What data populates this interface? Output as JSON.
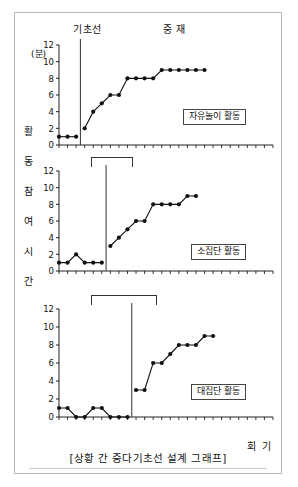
{
  "figure": {
    "caption": "[상황 간 중다기초선 설계 그래프]",
    "y_axis_title_chars": [
      "활",
      "동",
      "참",
      "여",
      "시",
      "간"
    ],
    "y_axis_unit": "(분)",
    "x_axis_title": "회 기",
    "phases": {
      "baseline": "기초선",
      "intervention": "중 재"
    }
  },
  "chart_data": [
    {
      "type": "line",
      "title": "자유놀이 활동",
      "panel_label": "자유놀이 활동",
      "xlabel": "회 기",
      "ylabel": "활동참여시간",
      "yunit": "(분)",
      "ylim": [
        0,
        12
      ],
      "yticks": [
        0,
        2,
        4,
        6,
        8,
        10,
        12
      ],
      "xlim": [
        1,
        26
      ],
      "xticks_count": 26,
      "grid": false,
      "legend": "none",
      "phase_change_x": 3.5,
      "series": [
        {
          "name": "기초선",
          "x": [
            1,
            2,
            3
          ],
          "values": [
            1,
            1,
            1
          ]
        },
        {
          "name": "중재",
          "x": [
            4,
            5,
            6,
            7,
            8,
            9,
            10,
            11,
            12,
            13,
            14,
            15,
            16,
            17,
            18
          ],
          "values": [
            2,
            4,
            5,
            6,
            6,
            8,
            8,
            8,
            8,
            9,
            9,
            9,
            9,
            9,
            9
          ]
        }
      ]
    },
    {
      "type": "line",
      "title": "소집단 활동",
      "panel_label": "소집단 활동",
      "xlabel": "회 기",
      "ylabel": "활동참여시간",
      "yunit": "(분)",
      "ylim": [
        0,
        12
      ],
      "yticks": [
        0,
        2,
        4,
        6,
        8,
        10,
        12
      ],
      "xlim": [
        1,
        26
      ],
      "xticks_count": 26,
      "grid": false,
      "legend": "none",
      "phase_change_x": 6.5,
      "series": [
        {
          "name": "기초선",
          "x": [
            1,
            2,
            3,
            4,
            5,
            6
          ],
          "values": [
            1,
            1,
            2,
            1,
            1,
            1
          ]
        },
        {
          "name": "중재",
          "x": [
            7,
            8,
            9,
            10,
            11,
            12,
            13,
            14,
            15,
            16,
            17
          ],
          "values": [
            3,
            4,
            5,
            6,
            6,
            8,
            8,
            8,
            8,
            9,
            9
          ]
        }
      ]
    },
    {
      "type": "line",
      "title": "대집단 활동",
      "panel_label": "대집단 활동",
      "xlabel": "회 기",
      "ylabel": "활동참여시간",
      "yunit": "(분)",
      "ylim": [
        0,
        12
      ],
      "yticks": [
        0,
        2,
        4,
        6,
        8,
        10,
        12
      ],
      "xlim": [
        1,
        26
      ],
      "xticks_count": 26,
      "grid": false,
      "legend": "none",
      "phase_change_x": 9.5,
      "series": [
        {
          "name": "기초선",
          "x": [
            1,
            2,
            3,
            4,
            5,
            6,
            7,
            8,
            9
          ],
          "values": [
            1,
            1,
            0,
            0,
            1,
            1,
            0,
            0,
            0
          ]
        },
        {
          "name": "중재",
          "x": [
            10,
            11,
            12,
            13,
            14,
            15,
            16,
            17,
            18,
            19
          ],
          "values": [
            3,
            3,
            6,
            6,
            7,
            8,
            8,
            8,
            9,
            9
          ]
        }
      ]
    }
  ],
  "style": {
    "line_color": "#111111",
    "marker_color": "#111111",
    "axis_color": "#222222",
    "frame_color": "#b8b8b8"
  }
}
